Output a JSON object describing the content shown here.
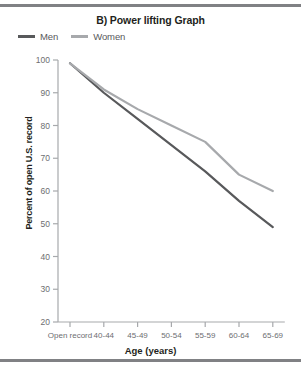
{
  "figure": {
    "title": "B) Power lifting Graph",
    "top_rule_color": "#808184",
    "bottom_rule_color": "#808184"
  },
  "legend": {
    "position": "top-left",
    "entries": [
      {
        "label": "Men",
        "color": "#58595b",
        "swatch_name": "legend-swatch-men"
      },
      {
        "label": "Women",
        "color": "#a7a9ac",
        "swatch_name": "legend-swatch-women"
      }
    ]
  },
  "chart_data": {
    "type": "line",
    "title": "B) Power lifting Graph",
    "xlabel": "Age (years)",
    "ylabel": "Percent of open U.S. record",
    "categories": [
      "Open record",
      "40-44",
      "45-49",
      "50-54",
      "55-59",
      "60-64",
      "65-69"
    ],
    "ylim": [
      20,
      100
    ],
    "yticks": [
      20,
      30,
      40,
      50,
      60,
      70,
      80,
      90,
      100
    ],
    "ytick_labels": [
      "20",
      "30",
      "40",
      "50",
      "60",
      "70",
      "80",
      "90",
      "100"
    ],
    "grid": false,
    "legend_position": "top-left",
    "series": [
      {
        "name": "Men",
        "color": "#58595b",
        "values": [
          99,
          90,
          82,
          74,
          66,
          57,
          49
        ]
      },
      {
        "name": "Women",
        "color": "#a7a9ac",
        "values": [
          99,
          91,
          85,
          80,
          75,
          65,
          60
        ]
      }
    ]
  },
  "axes": {
    "axis_color": "#a7a9ac",
    "tick_color": "#a7a9ac"
  }
}
